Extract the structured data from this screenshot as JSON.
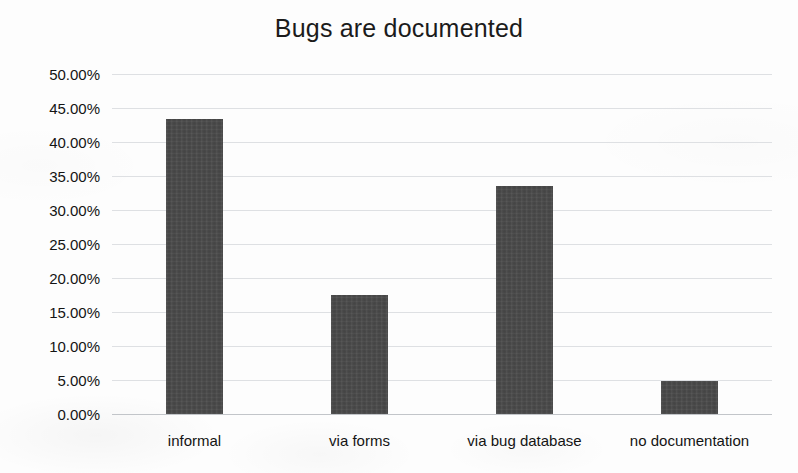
{
  "chart_data": {
    "type": "bar",
    "title": "Bugs are documented",
    "xlabel": "",
    "ylabel": "",
    "categories": [
      "informal",
      "via forms",
      "via bug database",
      "no documentation"
    ],
    "values": [
      43.4,
      17.5,
      33.5,
      4.85
    ],
    "value_labels": [
      "43.40%",
      "17.50%",
      "33.50%",
      "4.85%"
    ],
    "ylim": [
      0,
      50
    ],
    "ytick_values": [
      0,
      5,
      10,
      15,
      20,
      25,
      30,
      35,
      40,
      45,
      50
    ],
    "ytick_labels": [
      "0.00%",
      "5.00%",
      "10.00%",
      "15.00%",
      "20.00%",
      "25.00%",
      "30.00%",
      "35.00%",
      "40.00%",
      "45.00%",
      "50.00%"
    ],
    "grid": true,
    "grid_axis": "y",
    "legend": false,
    "legend_position": "none",
    "bar_color": "#4a4a4a",
    "grid_color": "#d8dade",
    "background_color": "#fdfdfd",
    "text_color": "#141414"
  }
}
